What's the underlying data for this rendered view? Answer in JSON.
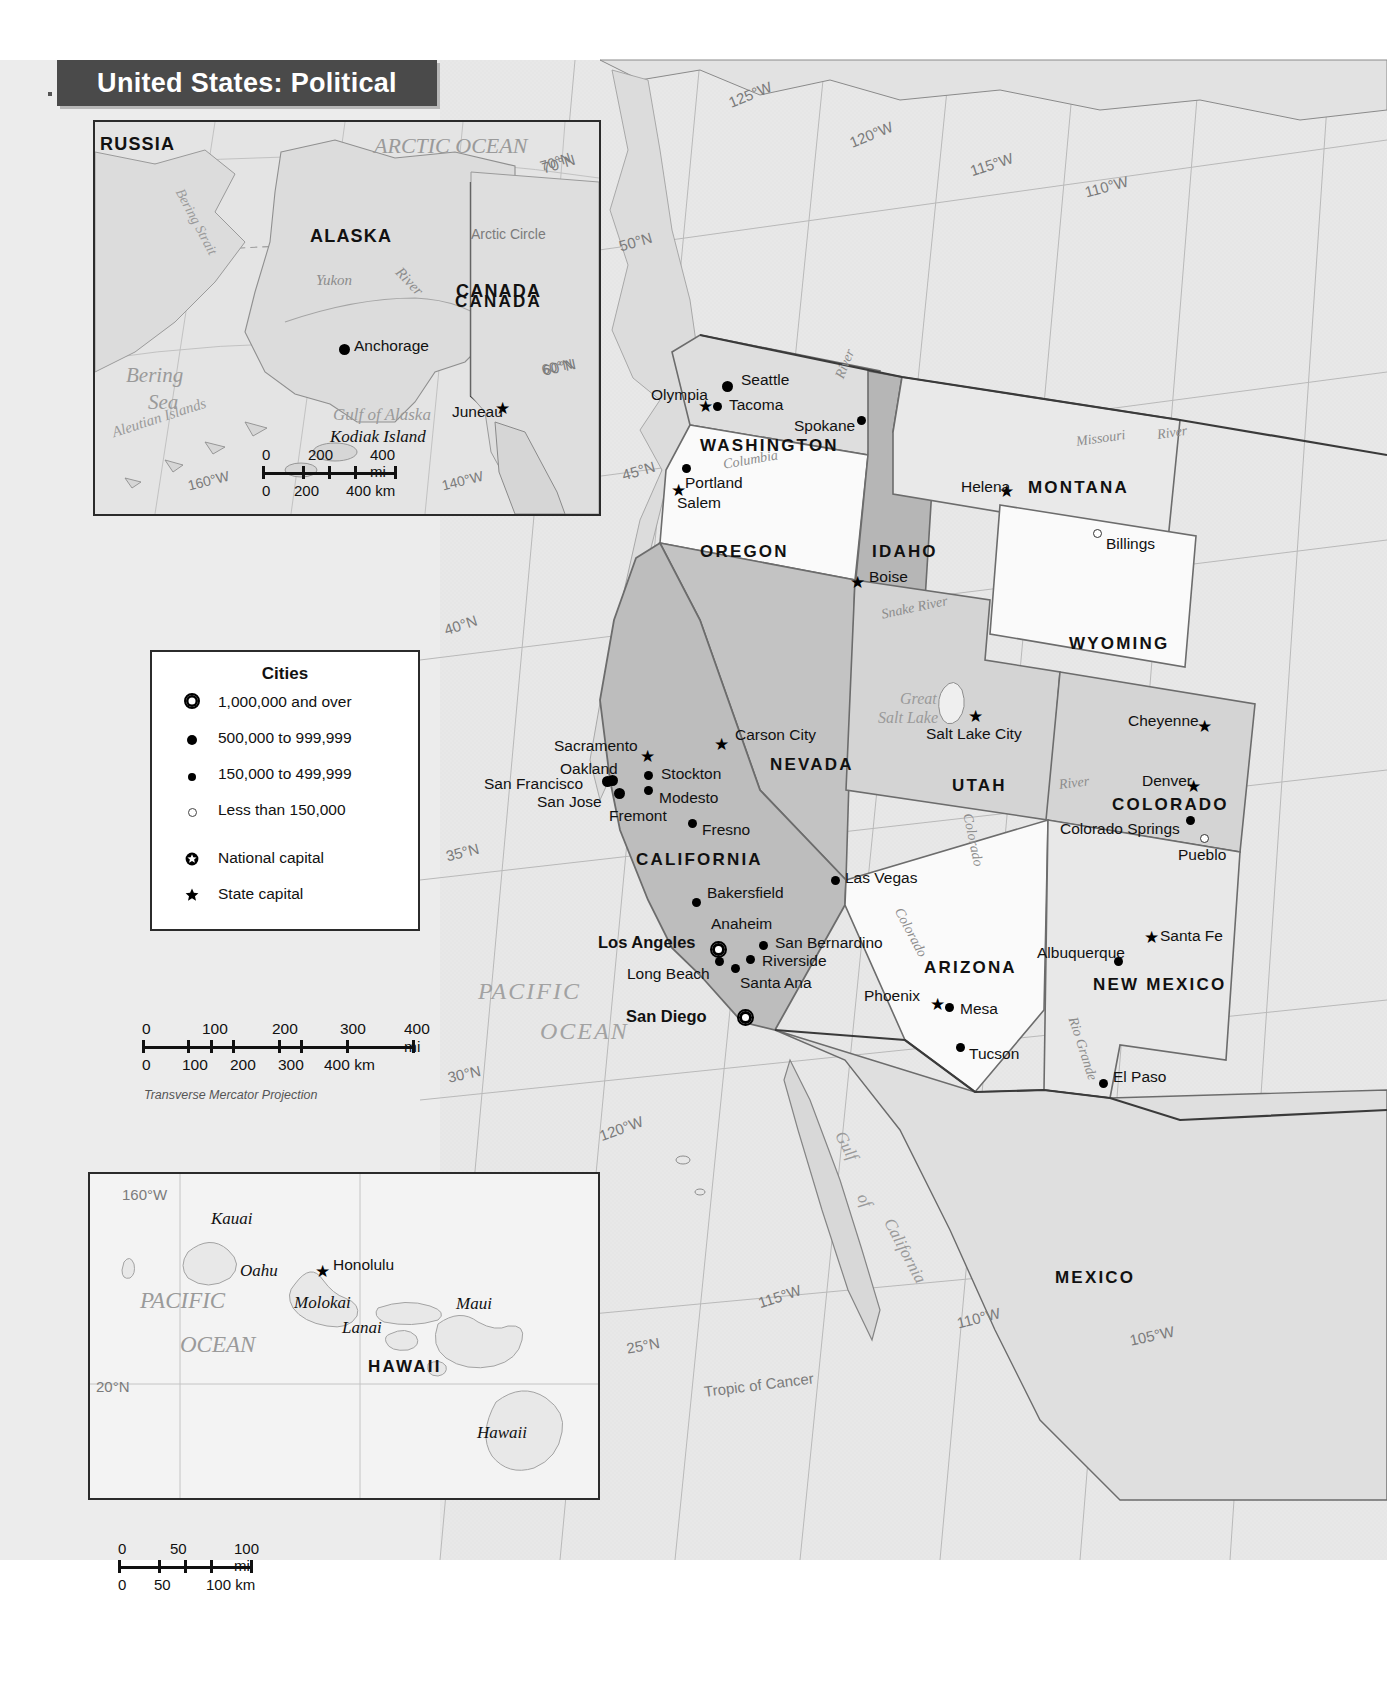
{
  "title": {
    "text": "United States: Political"
  },
  "main_map": {
    "projection_note": "Transverse Mercator Projection",
    "countries": [
      {
        "name": "MEXICO",
        "x": 1055,
        "y": 1268
      },
      {
        "name": "CANADA",
        "x": 455,
        "y": 292
      }
    ],
    "states": [
      {
        "name": "WASHINGTON",
        "x": 700,
        "y": 436,
        "size": "state"
      },
      {
        "name": "OREGON",
        "x": 700,
        "y": 542,
        "size": "state"
      },
      {
        "name": "IDAHO",
        "x": 872,
        "y": 542,
        "size": "state"
      },
      {
        "name": "MONTANA",
        "x": 1028,
        "y": 478,
        "size": "state"
      },
      {
        "name": "WYOMING",
        "x": 1069,
        "y": 634,
        "size": "state"
      },
      {
        "name": "NEVADA",
        "x": 770,
        "y": 755,
        "size": "state"
      },
      {
        "name": "UTAH",
        "x": 952,
        "y": 776,
        "size": "state"
      },
      {
        "name": "COLORADO",
        "x": 1112,
        "y": 795,
        "size": "state"
      },
      {
        "name": "CALIFORNIA",
        "x": 636,
        "y": 850,
        "size": "state"
      },
      {
        "name": "ARIZONA",
        "x": 924,
        "y": 958,
        "size": "state"
      },
      {
        "name": "NEW MEXICO",
        "x": 1093,
        "y": 975,
        "size": "state"
      }
    ],
    "cities": [
      {
        "name": "Seattle",
        "tier": "lg",
        "dot_x": 727,
        "dot_y": 386,
        "lx": 741,
        "ly": 371
      },
      {
        "name": "Tacoma",
        "tier": "md",
        "dot_x": 717,
        "dot_y": 406,
        "lx": 729,
        "ly": 396
      },
      {
        "name": "Olympia",
        "tier": "star",
        "dot_x": 706,
        "dot_y": 407,
        "lx": 651,
        "ly": 386,
        "capital": "state"
      },
      {
        "name": "Spokane",
        "tier": "md",
        "dot_x": 861,
        "dot_y": 420,
        "lx": 794,
        "ly": 417
      },
      {
        "name": "Portland",
        "tier": "md",
        "dot_x": 686,
        "dot_y": 468,
        "lx": 685,
        "ly": 474
      },
      {
        "name": "Salem",
        "tier": "star",
        "dot_x": 679,
        "dot_y": 491,
        "lx": 677,
        "ly": 494,
        "capital": "state"
      },
      {
        "name": "Helena",
        "tier": "star",
        "dot_x": 1007,
        "dot_y": 492,
        "lx": 961,
        "ly": 478,
        "capital": "state"
      },
      {
        "name": "Billings",
        "tier": "sm",
        "dot_x": 1096,
        "dot_y": 532,
        "lx": 1106,
        "ly": 535
      },
      {
        "name": "Boise",
        "tier": "star",
        "dot_x": 858,
        "dot_y": 583,
        "lx": 869,
        "ly": 568,
        "capital": "state"
      },
      {
        "name": "Cheyenne",
        "tier": "star",
        "dot_x": 1205,
        "dot_y": 727,
        "lx": 1128,
        "ly": 712,
        "capital": "state"
      },
      {
        "name": "Carson City",
        "tier": "star",
        "dot_x": 722,
        "dot_y": 745,
        "lx": 735,
        "ly": 726,
        "capital": "state"
      },
      {
        "name": "Salt Lake City",
        "tier": "star",
        "dot_x": 976,
        "dot_y": 717,
        "lx": 926,
        "ly": 725,
        "capital": "state"
      },
      {
        "name": "Sacramento",
        "tier": "star",
        "dot_x": 648,
        "dot_y": 757,
        "lx": 554,
        "ly": 737,
        "capital": "state"
      },
      {
        "name": "Denver",
        "tier": "star",
        "dot_x": 1194,
        "dot_y": 787,
        "lx": 1142,
        "ly": 772
      },
      {
        "name": "Oakland",
        "tier": "lg",
        "dot_x": 612,
        "dot_y": 780,
        "lx": 560,
        "ly": 760
      },
      {
        "name": "Stockton",
        "tier": "md",
        "dot_x": 648,
        "dot_y": 775,
        "lx": 661,
        "ly": 765
      },
      {
        "name": "San Francisco",
        "tier": "lg",
        "dot_x": 607,
        "dot_y": 781,
        "lx": 484,
        "ly": 775
      },
      {
        "name": "Modesto",
        "tier": "md",
        "dot_x": 648,
        "dot_y": 790,
        "lx": 659,
        "ly": 789
      },
      {
        "name": "San Jose",
        "tier": "lg",
        "dot_x": 619,
        "dot_y": 793,
        "lx": 537,
        "ly": 793
      },
      {
        "name": "Fremont",
        "tier": "none",
        "dot_x": 0,
        "dot_y": 0,
        "lx": 609,
        "ly": 807
      },
      {
        "name": "Colorado Springs",
        "tier": "md",
        "dot_x": 1190,
        "dot_y": 820,
        "lx": 1060,
        "ly": 820
      },
      {
        "name": "Pueblo",
        "tier": "sm",
        "dot_x": 1203,
        "dot_y": 837,
        "lx": 1178,
        "ly": 846
      },
      {
        "name": "Fresno",
        "tier": "md",
        "dot_x": 692,
        "dot_y": 823,
        "lx": 702,
        "ly": 821
      },
      {
        "name": "Las Vegas",
        "tier": "md",
        "dot_x": 835,
        "dot_y": 880,
        "lx": 845,
        "ly": 869
      },
      {
        "name": "Bakersfield",
        "tier": "md",
        "dot_x": 696,
        "dot_y": 902,
        "lx": 707,
        "ly": 884
      },
      {
        "name": "Santa Fe",
        "tier": "star",
        "dot_x": 1152,
        "dot_y": 938,
        "lx": 1160,
        "ly": 927,
        "capital": "state"
      },
      {
        "name": "Anaheim",
        "tier": "none",
        "dot_x": 0,
        "dot_y": 0,
        "lx": 711,
        "ly": 915
      },
      {
        "name": "San Bernardino",
        "tier": "md",
        "dot_x": 763,
        "dot_y": 945,
        "lx": 775,
        "ly": 934
      },
      {
        "name": "Albuquerque",
        "tier": "md",
        "dot_x": 1118,
        "dot_y": 961,
        "lx": 1037,
        "ly": 944
      },
      {
        "name": "Los Angeles",
        "tier": "metro",
        "dot_x": 716,
        "dot_y": 947,
        "lx": 598,
        "ly": 933
      },
      {
        "name": "Riverside",
        "tier": "md",
        "dot_x": 750,
        "dot_y": 959,
        "lx": 762,
        "ly": 952
      },
      {
        "name": "Long Beach",
        "tier": "md",
        "dot_x": 719,
        "dot_y": 961,
        "lx": 627,
        "ly": 965
      },
      {
        "name": "Santa Ana",
        "tier": "md",
        "dot_x": 735,
        "dot_y": 968,
        "lx": 740,
        "ly": 974
      },
      {
        "name": "Phoenix",
        "tier": "star",
        "dot_x": 938,
        "dot_y": 1005,
        "lx": 864,
        "ly": 987,
        "capital": "state"
      },
      {
        "name": "Mesa",
        "tier": "md",
        "dot_x": 949,
        "dot_y": 1007,
        "lx": 960,
        "ly": 1000
      },
      {
        "name": "San Diego",
        "tier": "metro",
        "dot_x": 743,
        "dot_y": 1015,
        "lx": 626,
        "ly": 1007
      },
      {
        "name": "Tucson",
        "tier": "md",
        "dot_x": 960,
        "dot_y": 1047,
        "lx": 969,
        "ly": 1045
      },
      {
        "name": "El Paso",
        "tier": "md",
        "dot_x": 1103,
        "dot_y": 1083,
        "lx": 1113,
        "ly": 1068
      }
    ],
    "water_labels": [
      {
        "name": "PACIFIC",
        "x": 478,
        "y": 978,
        "cls": "water-lg"
      },
      {
        "name": "OCEAN",
        "x": 540,
        "y": 1018,
        "cls": "water-lg"
      },
      {
        "name": "Great",
        "x": 900,
        "y": 690,
        "cls": "water",
        "size": 16
      },
      {
        "name": "Salt Lake",
        "x": 878,
        "y": 709,
        "cls": "water",
        "size": 16
      },
      {
        "name": "Gulf",
        "x": 848,
        "y": 1128,
        "cls": "water",
        "size": 17,
        "rot": 62
      },
      {
        "name": "of",
        "x": 870,
        "y": 1190,
        "cls": "water",
        "size": 17,
        "rot": 62
      },
      {
        "name": "California",
        "x": 897,
        "y": 1215,
        "cls": "water",
        "size": 17,
        "rot": 62
      }
    ],
    "rivers": [
      {
        "name": "Columbia",
        "x": 722,
        "y": 457,
        "rot": -10
      },
      {
        "name": "River",
        "x": 832,
        "y": 375,
        "rot": -68
      },
      {
        "name": "Missouri",
        "x": 1075,
        "y": 434,
        "rot": -8
      },
      {
        "name": "River",
        "x": 1156,
        "y": 427,
        "rot": -8
      },
      {
        "name": "Snake River",
        "x": 880,
        "y": 607,
        "rot": -12
      },
      {
        "name": "Colorado",
        "x": 975,
        "y": 812,
        "rot": 78
      },
      {
        "name": "River",
        "x": 1058,
        "y": 777,
        "rot": -7
      },
      {
        "name": "Colorado",
        "x": 905,
        "y": 905,
        "rot": 62
      },
      {
        "name": "Rio Grande",
        "x": 1080,
        "y": 1015,
        "rot": 72
      }
    ],
    "grid_labels": [
      {
        "name": "125°W",
        "x": 726,
        "y": 95,
        "rot": -22
      },
      {
        "name": "120°W",
        "x": 847,
        "y": 135,
        "rot": -22
      },
      {
        "name": "115°W",
        "x": 968,
        "y": 163,
        "rot": -18
      },
      {
        "name": "110°W",
        "x": 1083,
        "y": 184,
        "rot": -15
      },
      {
        "name": "50°N",
        "x": 617,
        "y": 238,
        "rot": -16
      },
      {
        "name": "70°N",
        "x": 540,
        "y": 160,
        "rot": -16
      },
      {
        "name": "60°N",
        "x": 541,
        "y": 362,
        "rot": -12
      },
      {
        "name": "45°N",
        "x": 620,
        "y": 467,
        "rot": -16
      },
      {
        "name": "40°N",
        "x": 442,
        "y": 622,
        "rot": -18
      },
      {
        "name": "35°N",
        "x": 444,
        "y": 848,
        "rot": -14
      },
      {
        "name": "30°N",
        "x": 446,
        "y": 1069,
        "rot": -12
      },
      {
        "name": "120°W",
        "x": 597,
        "y": 1128,
        "rot": -20
      },
      {
        "name": "115°W",
        "x": 756,
        "y": 1295,
        "rot": -18
      },
      {
        "name": "110°W",
        "x": 955,
        "y": 1315,
        "rot": -14
      },
      {
        "name": "105°W",
        "x": 1128,
        "y": 1332,
        "rot": -12
      },
      {
        "name": "25°N",
        "x": 625,
        "y": 1340,
        "rot": -10
      },
      {
        "name": "Tropic of Cancer",
        "x": 703,
        "y": 1383,
        "rot": -7
      }
    ]
  },
  "alaska_inset": {
    "labels": [
      {
        "name": "RUSSIA",
        "x": 100,
        "y": 134,
        "cls": "country"
      },
      {
        "name": "ALASKA",
        "x": 310,
        "y": 226,
        "cls": "country"
      },
      {
        "name": "CANADA",
        "x": 456,
        "y": 281,
        "cls": "country"
      },
      {
        "name": "ARCTIC OCEAN",
        "x": 374,
        "y": 133,
        "cls": "water",
        "size": 22
      },
      {
        "name": "Bering",
        "x": 126,
        "y": 363,
        "cls": "water",
        "size": 21
      },
      {
        "name": "Sea",
        "x": 148,
        "y": 390,
        "cls": "water",
        "size": 21
      },
      {
        "name": "Bering Strait",
        "x": 186,
        "y": 186,
        "cls": "water",
        "size": 14,
        "rot": 62
      },
      {
        "name": "Aleutian Islands",
        "x": 110,
        "y": 425,
        "cls": "water",
        "size": 15,
        "rot": -18
      },
      {
        "name": "Yukon",
        "x": 316,
        "y": 272,
        "cls": "river",
        "size": 15
      },
      {
        "name": "River",
        "x": 404,
        "y": 264,
        "cls": "river",
        "size": 15,
        "rot": 46
      },
      {
        "name": "Gulf of Alaska",
        "x": 333,
        "y": 405,
        "cls": "water",
        "size": 17
      },
      {
        "name": "Kodiak Island",
        "x": 330,
        "y": 427,
        "cls": "island",
        "size": 17
      },
      {
        "name": "Arctic Circle",
        "x": 471,
        "y": 226,
        "cls": "grid-lbl",
        "size": 14
      },
      {
        "name": "70°N",
        "x": 538,
        "y": 159,
        "cls": "grid-lbl",
        "size": 14,
        "rot": -18
      },
      {
        "name": "60°N",
        "x": 540,
        "y": 362,
        "cls": "grid-lbl",
        "size": 14,
        "rot": -12
      },
      {
        "name": "160°W",
        "x": 186,
        "y": 478,
        "cls": "grid-lbl",
        "size": 14,
        "rot": -14
      },
      {
        "name": "140°W",
        "x": 440,
        "y": 478,
        "cls": "grid-lbl",
        "size": 14,
        "rot": -14
      }
    ],
    "cities": [
      {
        "name": "Anchorage",
        "tier": "lg",
        "dot_x": 344,
        "dot_y": 349,
        "lx": 354,
        "ly": 337
      },
      {
        "name": "Juneau",
        "tier": "star",
        "dot_x": 503,
        "dot_y": 409,
        "lx": 452,
        "ly": 403,
        "capital": "state"
      }
    ],
    "scale": {
      "mi_labels": [
        "0",
        "200",
        "400 mi"
      ],
      "km_labels": [
        "0",
        "200",
        "400 km"
      ]
    }
  },
  "hawaii_inset": {
    "labels": [
      {
        "name": "160°W",
        "x": 122,
        "y": 1186,
        "cls": "grid-lbl",
        "size": 15
      },
      {
        "name": "Kauai",
        "x": 211,
        "y": 1209,
        "cls": "island"
      },
      {
        "name": "Oahu",
        "x": 240,
        "y": 1261,
        "cls": "island"
      },
      {
        "name": "Honolulu",
        "x": 333,
        "y": 1256,
        "cls": "city"
      },
      {
        "name": "Molokai",
        "x": 294,
        "y": 1293,
        "cls": "island"
      },
      {
        "name": "Maui",
        "x": 456,
        "y": 1294,
        "cls": "island"
      },
      {
        "name": "Lanai",
        "x": 342,
        "y": 1318,
        "cls": "island"
      },
      {
        "name": "PACIFIC",
        "x": 140,
        "y": 1288,
        "cls": "water",
        "size": 23
      },
      {
        "name": "OCEAN",
        "x": 180,
        "y": 1332,
        "cls": "water",
        "size": 23
      },
      {
        "name": "HAWAII",
        "x": 368,
        "y": 1357,
        "cls": "state"
      },
      {
        "name": "20°N",
        "x": 96,
        "y": 1378,
        "cls": "grid-lbl",
        "size": 15
      },
      {
        "name": "Hawaii",
        "x": 477,
        "y": 1423,
        "cls": "island"
      }
    ],
    "cities": [
      {
        "name": "Honolulu",
        "tier": "star",
        "dot_x": 323,
        "dot_y": 1272,
        "capital": "state"
      }
    ],
    "scale": {
      "mi_labels": [
        "0",
        "50",
        "100 mi"
      ],
      "km_labels": [
        "0",
        "50",
        "100 km"
      ]
    }
  },
  "legend": {
    "title": "Cities",
    "items": [
      {
        "symbol": "metro",
        "label": "1,000,000 and over"
      },
      {
        "symbol": "lg",
        "label": "500,000 to 999,999"
      },
      {
        "symbol": "md",
        "label": "150,000 to 499,999"
      },
      {
        "symbol": "sm",
        "label": "Less than 150,000"
      },
      {
        "symbol": "national-capital",
        "label": "National capital"
      },
      {
        "symbol": "state-capital",
        "label": "State capital"
      }
    ]
  },
  "main_scale": {
    "mi_labels": [
      "0",
      "100",
      "200",
      "300",
      "400 mi"
    ],
    "km_labels": [
      "0",
      "100",
      "200",
      "300",
      "400 km"
    ],
    "projection": "Transverse Mercator Projection"
  },
  "colors": {
    "ocean": "#e6e6e6",
    "land_light": "#f7f7f7",
    "land_mid": "#d6d6d6",
    "land_dark": "#b3b3b3",
    "border": "#555555",
    "banner": "#4a4a4a"
  }
}
